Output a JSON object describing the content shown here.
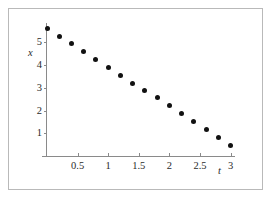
{
  "chart_data": {
    "type": "scatter",
    "title": "",
    "xlabel": "t",
    "ylabel": "x",
    "xlim": [
      -0.08,
      3.18
    ],
    "ylim": [
      0,
      5.95
    ],
    "grid": false,
    "legend": null,
    "marker": {
      "shape": "circle",
      "color": "#111111",
      "size_px": 5
    },
    "axis_color": "#8a8a8a",
    "frame_color": "#b9b9b9",
    "background": "#ffffff",
    "x_ticks": [
      {
        "value": 0.5,
        "label": "0.5"
      },
      {
        "value": 1,
        "label": "1"
      },
      {
        "value": 1.5,
        "label": "1.5"
      },
      {
        "value": 2,
        "label": "2"
      },
      {
        "value": 2.5,
        "label": "2.5"
      },
      {
        "value": 3,
        "label": "3"
      }
    ],
    "y_ticks": [
      {
        "value": 1,
        "label": "1"
      },
      {
        "value": 2,
        "label": "2"
      },
      {
        "value": 3,
        "label": "3"
      },
      {
        "value": 4,
        "label": "4"
      },
      {
        "value": 5,
        "label": "5"
      }
    ],
    "x": [
      0,
      0.2,
      0.4,
      0.6,
      0.8,
      1.0,
      1.2,
      1.4,
      1.6,
      1.8,
      2.0,
      2.2,
      2.4,
      2.6,
      2.8,
      3.0
    ],
    "values": [
      5.6,
      5.25,
      4.95,
      4.6,
      4.25,
      3.9,
      3.55,
      3.2,
      2.9,
      2.55,
      2.2,
      1.88,
      1.52,
      1.18,
      0.8,
      0.45
    ],
    "series": [
      {
        "name": "x(t)",
        "values": [
          5.6,
          5.25,
          4.95,
          4.6,
          4.25,
          3.9,
          3.55,
          3.2,
          2.9,
          2.55,
          2.2,
          1.88,
          1.52,
          1.18,
          0.8,
          0.45
        ]
      }
    ]
  }
}
